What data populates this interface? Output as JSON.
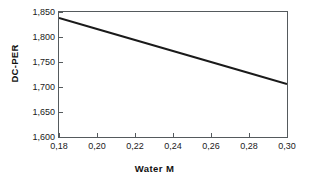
{
  "chart_data": {
    "type": "line",
    "title": "",
    "subtitle": "",
    "xlabel": "Water  M",
    "ylabel": "DC-PER",
    "xlim": [
      0.18,
      0.3
    ],
    "ylim": [
      1600,
      1850
    ],
    "grid": false,
    "legend": null,
    "legend_position": "none",
    "xticks": [
      0.18,
      0.2,
      0.22,
      0.24,
      0.26,
      0.28,
      0.3
    ],
    "xticklabels": [
      "0,18",
      "0,20",
      "0,22",
      "0,24",
      "0,26",
      "0,28",
      "0,30"
    ],
    "yticks": [
      1600,
      1650,
      1700,
      1750,
      1800,
      1850
    ],
    "yticklabels": [
      "1,600",
      "1,650",
      "1,700",
      "1,750",
      "1,800",
      "1,850"
    ],
    "decimal_separator": ",",
    "thousands_separator": ",",
    "series": [
      {
        "name": "DC-PER vs Water M",
        "color": "#1a1a1a",
        "line_width": 2,
        "x": [
          0.18,
          0.2,
          0.22,
          0.24,
          0.26,
          0.28,
          0.3
        ],
        "values": [
          1838,
          1816,
          1794,
          1772,
          1750,
          1728,
          1706
        ]
      }
    ],
    "annotations": []
  },
  "axis": {
    "frame_color": "#555a5d",
    "tick_color": "#555a5d",
    "label_color": "#1a1a1a"
  },
  "figure": {
    "background": "#ffffff"
  }
}
